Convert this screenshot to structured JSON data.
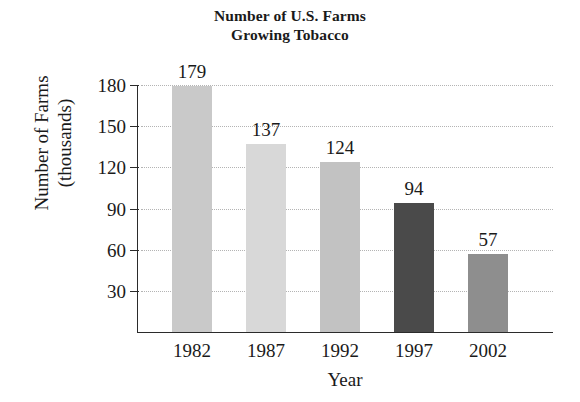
{
  "chart_data": {
    "type": "bar",
    "title": "Number of U.S. Farms Growing Tobacco",
    "title_lines": [
      "Number of U.S. Farms",
      "Growing Tobacco"
    ],
    "xlabel": "Year",
    "ylabel": "Number of Farms (thousands)",
    "ylabel_lines": [
      "Number of Farms",
      "(thousands)"
    ],
    "categories": [
      "1982",
      "1987",
      "1992",
      "1997",
      "2002"
    ],
    "values": [
      179,
      137,
      124,
      94,
      57
    ],
    "value_labels": [
      "179",
      "137",
      "124",
      "94",
      "57"
    ],
    "bar_colors": [
      "#c9c9c9",
      "#d8d8d8",
      "#c2c2c2",
      "#4a4a4a",
      "#8e8e8e"
    ],
    "ylim": [
      0,
      180
    ],
    "yticks": [
      30,
      60,
      90,
      120,
      150,
      180
    ],
    "ytick_labels": [
      "30",
      "60",
      "90",
      "120",
      "150",
      "180"
    ],
    "grid": true,
    "grid_style": "dotted",
    "grid_color": "#b4b4b4",
    "legend": false,
    "axis_color": "#2b2b2b",
    "background": "#ffffff",
    "text_color": "#1a1a1a"
  }
}
